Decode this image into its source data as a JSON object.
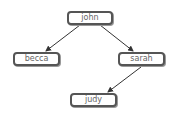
{
  "diagram": {
    "type": "tree",
    "nodes": [
      {
        "id": "john",
        "label": "john",
        "x": 67,
        "y": 11,
        "w": 46
      },
      {
        "id": "becca",
        "label": "becca",
        "x": 13,
        "y": 52,
        "w": 47
      },
      {
        "id": "sarah",
        "label": "sarah",
        "x": 118,
        "y": 52,
        "w": 47
      },
      {
        "id": "judy",
        "label": "judy",
        "x": 70,
        "y": 93,
        "w": 47
      }
    ],
    "edges": [
      {
        "from": "john",
        "to": "becca"
      },
      {
        "from": "john",
        "to": "sarah"
      },
      {
        "from": "sarah",
        "to": "judy"
      }
    ],
    "colors": {
      "border": "#555555",
      "text": "#666666",
      "edge": "#333333"
    }
  }
}
